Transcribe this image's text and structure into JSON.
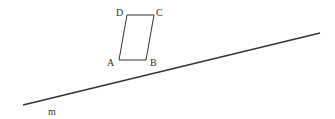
{
  "figure": {
    "parallelogram": {
      "vertices": {
        "A": {
          "label": "A",
          "x": 119,
          "y": 60
        },
        "B": {
          "label": "B",
          "x": 146,
          "y": 60
        },
        "C": {
          "label": "C",
          "x": 154,
          "y": 15
        },
        "D": {
          "label": "D",
          "x": 127,
          "y": 15
        }
      }
    },
    "line": {
      "label": "m",
      "x1": 23,
      "y1": 105,
      "x2": 320,
      "y2": 33
    },
    "stroke_color": "#333333"
  }
}
